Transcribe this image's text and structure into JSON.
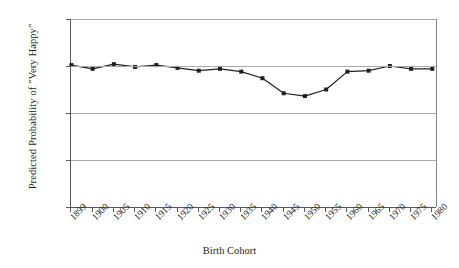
{
  "chart_data": {
    "type": "line",
    "title": "",
    "xlabel": "Birth Cohort",
    "ylabel": "Predicted Probability of \"Very Happy\"",
    "categories": [
      "1899",
      "1900",
      "1905",
      "1910",
      "1915",
      "1920",
      "1925",
      "1930",
      "1935",
      "1940",
      "1945",
      "1950",
      "1955",
      "1960",
      "1965",
      "1970",
      "1975",
      "1980"
    ],
    "values": [
      0.351,
      0.347,
      0.352,
      0.349,
      0.351,
      0.348,
      0.345,
      0.347,
      0.344,
      0.337,
      0.321,
      0.318,
      0.325,
      0.344,
      0.345,
      0.35,
      0.347,
      0.347
    ],
    "ylim": [
      0.2,
      0.4
    ],
    "yticks": [
      "0.20",
      "0.25",
      "0.30",
      "0.35",
      "0.40"
    ],
    "ytick_values": [
      0.2,
      0.25,
      0.3,
      0.35,
      0.4
    ],
    "grid": true,
    "legend": "none",
    "marker": "square",
    "line_color": "#231f20",
    "marker_color": "#231f20",
    "grid_color": "#a7a9ac"
  }
}
